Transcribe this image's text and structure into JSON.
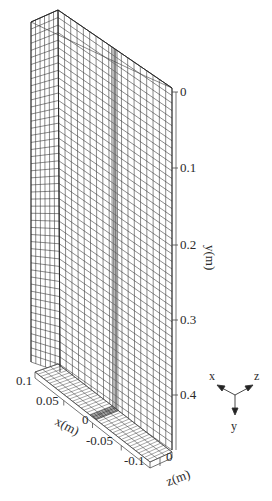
{
  "figure": {
    "type": "3d-mesh-diagram",
    "colors": {
      "mesh_line": "#3a3a3a",
      "strip": "#6a6a6a",
      "axis": "#444444",
      "background": "#ffffff"
    }
  },
  "axes": {
    "y": {
      "label": "y(m)",
      "ticks": [
        "0",
        "0.1",
        "0.2",
        "0.3",
        "0.4"
      ]
    },
    "x": {
      "label": "x(m)",
      "ticks": [
        "0.1",
        "0.05",
        "0",
        "-0.05",
        "-0.1"
      ]
    },
    "z": {
      "label": "z(m)",
      "ticks": [
        "0"
      ]
    }
  },
  "triad": {
    "x_label": "x",
    "y_label": "y",
    "z_label": "z"
  }
}
